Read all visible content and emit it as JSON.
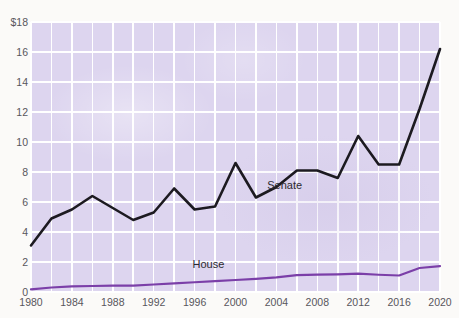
{
  "top_caption": "",
  "chart_data": {
    "type": "line",
    "title": "",
    "subtitle": "",
    "xlabel": "",
    "ylabel": "",
    "y_axis_prefix": "$",
    "ylim": [
      0,
      18
    ],
    "xlim": [
      1980,
      2020
    ],
    "grid": true,
    "legend_position": "inline",
    "y_ticks": [
      0,
      2,
      4,
      6,
      8,
      10,
      12,
      14,
      16,
      18
    ],
    "y_tick_labels": [
      "0",
      "2",
      "4",
      "6",
      "8",
      "10",
      "12",
      "14",
      "16",
      "$18"
    ],
    "x_ticks": [
      1980,
      1984,
      1988,
      1992,
      1996,
      2000,
      2004,
      2008,
      2012,
      2016,
      2020
    ],
    "x_tick_labels": [
      "1980",
      "1984",
      "1988",
      "1992",
      "1996",
      "2000",
      "2004",
      "2008",
      "2012",
      "2016",
      "2020"
    ],
    "x_gridline_years": [
      1980,
      1982,
      1984,
      1986,
      1988,
      1990,
      1992,
      1994,
      1996,
      1998,
      2000,
      2002,
      2004,
      2006,
      2008,
      2010,
      2012,
      2014,
      2016,
      2018,
      2020
    ],
    "x": [
      1980,
      1982,
      1984,
      1986,
      1988,
      1990,
      1992,
      1994,
      1996,
      1998,
      2000,
      2002,
      2004,
      2006,
      2008,
      2010,
      2012,
      2014,
      2016,
      2018,
      2020
    ],
    "series": [
      {
        "name": "Senate",
        "color": "#1c1a20",
        "label_x": 2003.1,
        "label_y": 7.05,
        "values": [
          3.1,
          4.9,
          5.5,
          6.4,
          5.6,
          4.8,
          5.3,
          6.9,
          5.5,
          5.7,
          8.6,
          6.3,
          7.0,
          8.1,
          8.1,
          7.6,
          10.4,
          8.5,
          8.5,
          12.2,
          16.2
        ]
      },
      {
        "name": "House",
        "color": "#7b3fa8",
        "label_x": 1995.8,
        "label_y": 1.82,
        "values": [
          0.18,
          0.3,
          0.38,
          0.4,
          0.42,
          0.43,
          0.5,
          0.58,
          0.65,
          0.72,
          0.8,
          0.88,
          0.98,
          1.12,
          1.16,
          1.18,
          1.22,
          1.15,
          1.1,
          1.6,
          1.72
        ]
      }
    ]
  }
}
